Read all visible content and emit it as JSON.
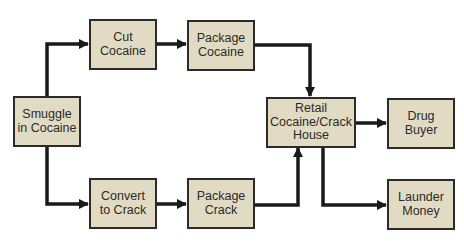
{
  "diagram": {
    "type": "flowchart",
    "colors": {
      "node_fill": "#e2dbc3",
      "node_border": "#2b2b2b",
      "arrow": "#1a1a1a"
    },
    "nodes": {
      "smuggle": {
        "label": "Smuggle\nin Cocaine"
      },
      "cut": {
        "label": "Cut\nCocaine"
      },
      "package_cocaine": {
        "label": "Package\nCocaine"
      },
      "convert": {
        "label": "Convert\nto Crack"
      },
      "package_crack": {
        "label": "Package\nCrack"
      },
      "retail": {
        "label": "Retail\nCocaine/Crack\nHouse"
      },
      "buyer": {
        "label": "Drug\nBuyer"
      },
      "launder": {
        "label": "Launder\nMoney"
      }
    },
    "edges": [
      {
        "from": "smuggle",
        "to": "cut"
      },
      {
        "from": "cut",
        "to": "package_cocaine"
      },
      {
        "from": "package_cocaine",
        "to": "retail"
      },
      {
        "from": "smuggle",
        "to": "convert"
      },
      {
        "from": "convert",
        "to": "package_crack"
      },
      {
        "from": "package_crack",
        "to": "retail"
      },
      {
        "from": "retail",
        "to": "buyer"
      },
      {
        "from": "retail",
        "to": "launder"
      }
    ]
  }
}
